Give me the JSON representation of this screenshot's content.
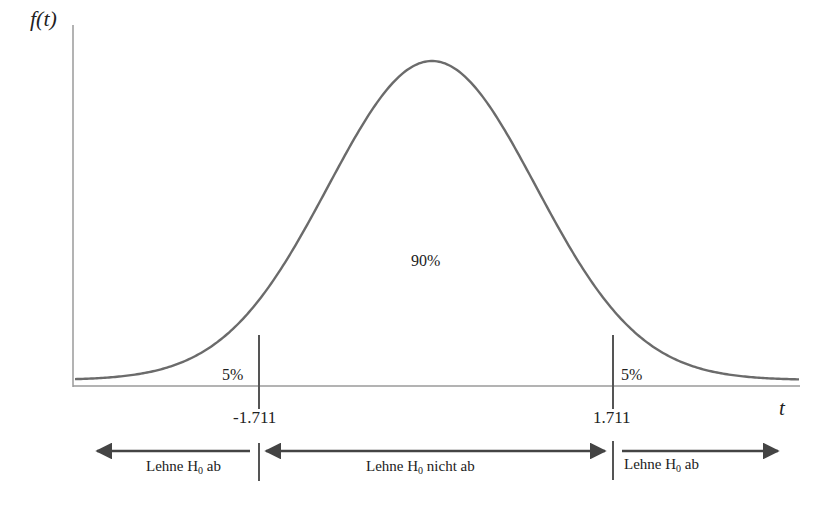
{
  "diagram": {
    "type": "t-distribution two-tailed rejection regions",
    "y_axis_label": "f(t)",
    "x_axis_label": "t",
    "areas": {
      "left_tail": "5%",
      "center": "90%",
      "right_tail": "5%"
    },
    "critical_values": {
      "lower": "-1.711",
      "upper": "1.711"
    },
    "regions": [
      {
        "text_pre": "Lehne H",
        "sub": "0",
        "text_post": " ab",
        "direction": "left"
      },
      {
        "text_pre": "Lehne H",
        "sub": "0",
        "text_post": " nicht ab",
        "direction": "both"
      },
      {
        "text_pre": "Lehne H",
        "sub": "0",
        "text_post": " ab",
        "direction": "right"
      }
    ],
    "colors": {
      "curve": "#6b6b6b",
      "axis": "#9a9a9a",
      "critical_line": "#555555",
      "arrow": "#444444",
      "text": "#222222"
    }
  }
}
